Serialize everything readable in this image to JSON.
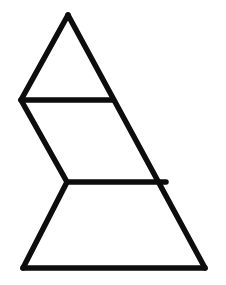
{
  "canvas": {
    "width": 226,
    "height": 285,
    "background_color": "#ffffff"
  },
  "figure": {
    "stroke_color": "#0d0d0d",
    "stroke_width": 5.5,
    "fill_color": "#ffffff",
    "vertex_labels": [
      "apex",
      "left-upper",
      "left-middle-notch",
      "bottom-left",
      "bottom-right",
      "right-upper-join",
      "right-middle-join"
    ]
  },
  "chart_data": {
    "type": "line",
    "xlabel": "",
    "ylabel": "",
    "xlim": [
      0,
      226
    ],
    "ylim": [
      285,
      0
    ],
    "grid": false,
    "legend": "none",
    "points": {
      "apex": [
        68,
        15
      ],
      "left_upper": [
        21,
        100
      ],
      "right_upper_join": [
        113,
        100
      ],
      "left_middle_notch": [
        67,
        182
      ],
      "right_middle_join": [
        166,
        182
      ],
      "bottom_left": [
        23,
        268
      ],
      "bottom_right": [
        205,
        268
      ]
    },
    "series": [
      {
        "name": "outline-left-boundary",
        "points": [
          [
            68,
            15
          ],
          [
            21,
            100
          ],
          [
            67,
            182
          ],
          [
            23,
            268
          ]
        ]
      },
      {
        "name": "outline-right-diagonal",
        "points": [
          [
            68,
            15
          ],
          [
            205,
            268
          ]
        ]
      },
      {
        "name": "outline-base",
        "points": [
          [
            23,
            268
          ],
          [
            205,
            268
          ]
        ]
      },
      {
        "name": "divider-upper-horizontal",
        "points": [
          [
            21,
            100
          ],
          [
            113,
            100
          ]
        ]
      },
      {
        "name": "divider-lower-horizontal",
        "points": [
          [
            67,
            182
          ],
          [
            166,
            182
          ]
        ]
      }
    ],
    "regions": [
      {
        "name": "upper-triangle",
        "polygon": [
          [
            68,
            15
          ],
          [
            113,
            100
          ],
          [
            21,
            100
          ]
        ]
      },
      {
        "name": "middle-band",
        "polygon": [
          [
            21,
            100
          ],
          [
            113,
            100
          ],
          [
            166,
            182
          ],
          [
            67,
            182
          ]
        ]
      },
      {
        "name": "lower-trapezoid",
        "polygon": [
          [
            67,
            182
          ],
          [
            166,
            182
          ],
          [
            205,
            268
          ],
          [
            23,
            268
          ]
        ]
      }
    ]
  }
}
